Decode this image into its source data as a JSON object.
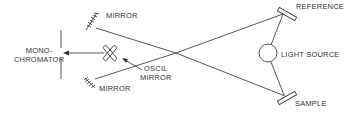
{
  "diagram": {
    "type": "optical-schematic",
    "labels": {
      "mirror_top": "MIRROR",
      "mirror_bottom": "MIRROR",
      "monochromator_line1": "MONO-",
      "monochromator_line2": "CHROMATOR",
      "oscil_line1": "OSCIL",
      "oscil_line2": "MIRROR",
      "reference": "REFERENCE",
      "light_source": "LIGHT SOURCE",
      "sample": "SAMPLE"
    },
    "colors": {
      "line": "#444444",
      "background": "#ffffff"
    }
  }
}
